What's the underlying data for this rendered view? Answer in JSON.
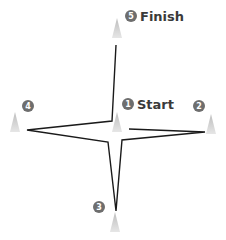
{
  "diagram": {
    "title": "",
    "colors": {
      "path": "#1a1a1a",
      "cone_top": "#c8c8c8",
      "cone_base": "#e3e3e3",
      "badge": "#6e6e6e",
      "label": "#3a3a3a"
    },
    "cones": [
      {
        "number": "1",
        "label": "Start",
        "cx": 117,
        "tip": 112,
        "base": 132,
        "badge_x": 128,
        "badge_y": 104,
        "label_x": 137,
        "label_y": 109
      },
      {
        "number": "2",
        "label": "",
        "cx": 211,
        "tip": 114,
        "base": 134,
        "badge_x": 199,
        "badge_y": 106,
        "label_x": 0,
        "label_y": 0
      },
      {
        "number": "3",
        "label": "",
        "cx": 115,
        "tip": 212,
        "base": 232,
        "badge_x": 99,
        "badge_y": 207,
        "label_x": 0,
        "label_y": 0
      },
      {
        "number": "4",
        "label": "",
        "cx": 15,
        "tip": 112,
        "base": 132,
        "badge_x": 28,
        "badge_y": 106,
        "label_x": 0,
        "label_y": 0
      },
      {
        "number": "5",
        "label": "Finish",
        "cx": 117,
        "tip": 18,
        "base": 38,
        "badge_x": 131,
        "badge_y": 16,
        "label_x": 140,
        "label_y": 21
      }
    ],
    "path_points": "129,129 205,132 122,140 116,211 108,142 27,130 112,121 116,45"
  }
}
